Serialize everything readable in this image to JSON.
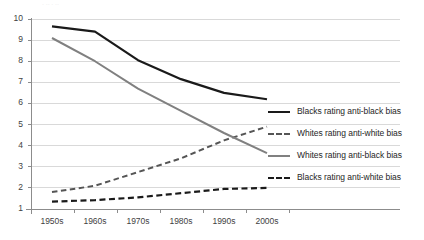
{
  "chart_data": {
    "type": "line",
    "title": "",
    "xlabel": "",
    "ylabel": "",
    "categories": [
      "1950s",
      "1960s",
      "1970s",
      "1980s",
      "1990s",
      "2000s"
    ],
    "ylim": [
      1,
      10
    ],
    "yticks": [
      1,
      2,
      3,
      4,
      5,
      6,
      7,
      8,
      9,
      10
    ],
    "ytick_labels": [
      "1",
      "2",
      "3",
      "4",
      "5",
      "6",
      "7",
      "8",
      "9",
      "10"
    ],
    "grid": "horizontal",
    "legend_position": "right",
    "series": [
      {
        "name": "Blacks rating anti-black bias",
        "style": "solid",
        "color": "#1a1a1a",
        "width": 2.2,
        "values": [
          9.65,
          9.4,
          8.05,
          7.15,
          6.5,
          6.2
        ]
      },
      {
        "name": "Whites rating anti-white bias",
        "style": "dashed",
        "color": "#555555",
        "width": 2.0,
        "values": [
          1.8,
          2.1,
          2.75,
          3.4,
          4.25,
          4.9
        ]
      },
      {
        "name": "Whites rating anti-black bias",
        "style": "solid",
        "color": "#808080",
        "width": 2.0,
        "values": [
          9.1,
          8.0,
          6.7,
          5.65,
          4.6,
          3.65
        ]
      },
      {
        "name": "Blacks rating anti-white bias",
        "style": "dashed",
        "color": "#1a1a1a",
        "width": 2.2,
        "values": [
          1.35,
          1.42,
          1.55,
          1.75,
          1.95,
          2.0
        ]
      }
    ]
  },
  "axes": {
    "axis_color": "#8c8c8c",
    "grid_color": "#d9d9d9",
    "tick_text_color": "#3f3f3f"
  },
  "top_fragment": "· ·· ·   ··"
}
